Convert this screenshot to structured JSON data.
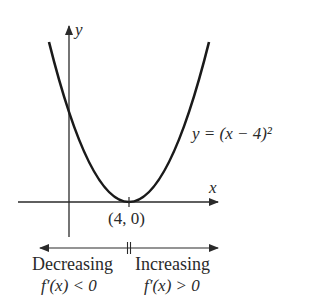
{
  "diagram": {
    "function_label": "y = (x − 4)²",
    "axes": {
      "x_label": "x",
      "y_label": "y"
    },
    "vertex_label": "(4, 0)",
    "intervals": [
      {
        "label": "Decreasing",
        "condition": "f′(x) < 0"
      },
      {
        "label": "Increasing",
        "condition": "f′(x) > 0"
      }
    ]
  }
}
